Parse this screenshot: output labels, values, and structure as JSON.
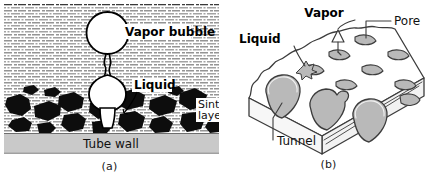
{
  "figure": {
    "panels": [
      {
        "id": "a",
        "caption": "(a)",
        "labels": {
          "vapor_bubble": "Vapor bubble",
          "liquid": "Liquid",
          "sintered_layer_line1": "Sintered",
          "sintered_layer_line2": "layer",
          "tube_wall": "Tube wall"
        },
        "colors": {
          "background": "#ffffff",
          "liquid_hatch": "#3a3a3a",
          "particles": "#0d0d0d",
          "tube_wall": "#c9c9c9",
          "tube_wall_edge": "#8f8f8f",
          "outline": "#000000"
        }
      },
      {
        "id": "b",
        "caption": "(b)",
        "labels": {
          "vapor": "Vapor",
          "pore": "Pore",
          "liquid": "Liquid",
          "tunnel": "Tunnel"
        },
        "colors": {
          "block_top": "#ffffff",
          "block_side": "#f2f2f2",
          "cavity_fill": "#b9b9b9",
          "cavity_fill_light": "#cfcfcf",
          "outline": "#3c3c3c"
        }
      }
    ]
  }
}
